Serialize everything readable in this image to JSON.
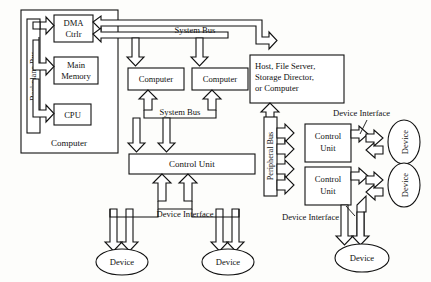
{
  "diagram": {
    "computer_subsystem": {
      "outer_label": "Computer",
      "bus_label": "Backplane Bus",
      "boxes": [
        {
          "id": "dma",
          "label_line1": "DMA",
          "label_line2": "Ctrlr"
        },
        {
          "id": "main-memory",
          "label_line1": "Main",
          "label_line2": "Memory"
        },
        {
          "id": "cpu",
          "label_line1": "CPU",
          "label_line2": ""
        }
      ]
    },
    "bus_labels": {
      "system_bus_top": "System Bus",
      "system_bus_middle": "System Bus",
      "peripheral_bus": "Peripheral Bus"
    },
    "nodes": {
      "computer_left": "Computer",
      "computer_right": "Computer",
      "host": {
        "line1": "Host, File Server,",
        "line2": "Storage Director,",
        "line3": "or Computer"
      },
      "control_unit_main": "Control Unit",
      "control_unit_upper_l1": "Control",
      "control_unit_upper_l2": "Unit",
      "control_unit_lower_l1": "Control",
      "control_unit_lower_l2": "Unit"
    },
    "device_interface_labels": [
      {
        "id": "di-center",
        "text": "Device Interface"
      },
      {
        "id": "di-top-right",
        "text": "Device Interface"
      },
      {
        "id": "di-bottom-right",
        "text": "Device Interface"
      }
    ],
    "devices": [
      {
        "id": "device-bottom-left",
        "label": "Device",
        "orientation": "horizontal"
      },
      {
        "id": "device-bottom-center",
        "label": "Device",
        "orientation": "horizontal"
      },
      {
        "id": "device-right-upper",
        "label": "Device",
        "orientation": "vertical"
      },
      {
        "id": "device-right-lower",
        "label": "Device",
        "orientation": "vertical"
      },
      {
        "id": "device-bottom-right",
        "label": "Device",
        "orientation": "horizontal"
      }
    ],
    "colors": {
      "stroke": "#111111",
      "fill": "#ffffff",
      "background": "#fdfdfb"
    }
  }
}
